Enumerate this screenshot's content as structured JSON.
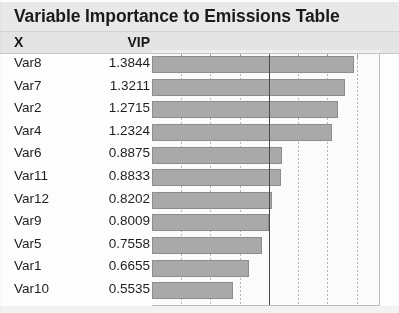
{
  "title": "Variable Importance to Emissions Table",
  "columns": {
    "x": "X",
    "vip": "VIP"
  },
  "rows": [
    {
      "x": "Var8",
      "vip": "1.3844"
    },
    {
      "x": "Var7",
      "vip": "1.3211"
    },
    {
      "x": "Var2",
      "vip": "1.2715"
    },
    {
      "x": "Var4",
      "vip": "1.2324"
    },
    {
      "x": "Var6",
      "vip": "0.8875"
    },
    {
      "x": "Var11",
      "vip": "0.8833"
    },
    {
      "x": "Var12",
      "vip": "0.8202"
    },
    {
      "x": "Var9",
      "vip": "0.8009"
    },
    {
      "x": "Var5",
      "vip": "0.7558"
    },
    {
      "x": "Var1",
      "vip": "0.6655"
    },
    {
      "x": "Var10",
      "vip": "0.5535"
    }
  ],
  "colors": {
    "bar_fill": "#a9a9a9",
    "bar_border": "#8d8d8d",
    "header_bg": "#e4e4e4",
    "title_bg": "#e8e8e8",
    "gridline": "#b6b6b6",
    "reference_line": "#4a4a4a",
    "text": "#1e1e1e"
  },
  "chart_data": {
    "type": "bar",
    "orientation": "horizontal",
    "title": "Variable Importance to Emissions Table",
    "xlabel": "VIP",
    "ylabel": "X",
    "categories": [
      "Var8",
      "Var7",
      "Var2",
      "Var4",
      "Var6",
      "Var11",
      "Var12",
      "Var9",
      "Var5",
      "Var1",
      "Var10"
    ],
    "values": [
      1.3844,
      1.3211,
      1.2715,
      1.2324,
      0.8875,
      0.8833,
      0.8202,
      0.8009,
      0.7558,
      0.6655,
      0.5535
    ],
    "xlim": [
      0,
      1.56
    ],
    "gridlines": [
      0.2,
      0.4,
      0.6,
      0.8,
      1.0,
      1.2,
      1.4
    ],
    "grid": "dotted-vertical",
    "reference_line": 0.8,
    "legend": "none",
    "tick_labels": []
  }
}
